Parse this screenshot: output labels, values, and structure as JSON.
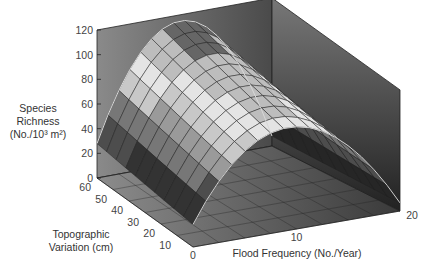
{
  "chart_data": {
    "type": "surface3d",
    "title": "",
    "zlabel_lines": [
      "Species",
      "Richness",
      "(No./10³ m²)"
    ],
    "xlabel": "Flood Frequency (No./Year)",
    "ylabel_lines": [
      "Topographic",
      "Variation (cm)"
    ],
    "z_ticks": [
      0,
      20,
      40,
      60,
      80,
      100,
      120
    ],
    "zlim": [
      0,
      120
    ],
    "y_ticks": [
      60,
      50,
      40,
      30,
      20,
      10
    ],
    "ylim": [
      0,
      60
    ],
    "x_ticks": [
      0,
      10,
      20
    ],
    "xlim": [
      0,
      20
    ],
    "surface": {
      "x_flood_frequency": [
        0,
        1.25,
        2.5,
        3.75,
        5,
        6.25,
        7.5,
        8.75,
        10,
        11.25,
        12.5,
        13.75,
        15,
        16.25,
        17.5,
        18.75,
        20
      ],
      "y_topographic_variation": [
        0,
        6,
        12,
        18,
        24,
        30,
        36,
        42,
        48,
        54,
        60
      ],
      "description": "Hump-shaped surface: species richness peaks (~110-115) at intermediate flood frequency (~9-10/yr) and increases with topographic variation; lowest (~10-30) at 0 and 20 floods/yr.",
      "peak_richness_at_max_topography": 115,
      "peak_richness_at_min_topography": 95,
      "edge_richness_low_flood": 28,
      "edge_richness_high_flood": 8
    },
    "colormap": "grayscale bands by height (dark low, light mid 60-90, dark high)",
    "grid": true
  },
  "colors": {
    "wall_left": "#7a7a7a",
    "wall_back": "#3a3a3a",
    "floor": "#6e6e6e",
    "grid_line": "#2a2a2a",
    "edge": "#cfcfcf"
  }
}
